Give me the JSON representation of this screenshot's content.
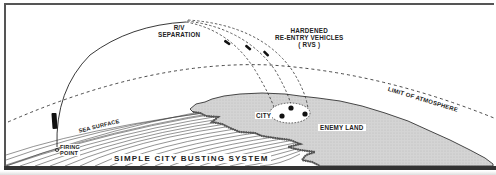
{
  "diagram": {
    "title": "SIMPLE CITY BUSTING SYSTEM",
    "labels": {
      "rv_separation": [
        "R/V",
        "SEPARATION"
      ],
      "hardened_rvs": [
        "HARDENED",
        "RE-ENTRY VEHICLES",
        "( RVS )"
      ],
      "limit_of_atmosphere": "LIMIT OF ATMOSPHERE",
      "sea_surface": "SEA SURFACE",
      "firing_point": [
        "FIRING",
        "POINT"
      ],
      "city": "CITY",
      "enemy_land": "ENEMY LAND"
    },
    "elements": {
      "trajectory": "ballistic-arc",
      "reentry_vehicle_count": 3,
      "city_target_markers": 3
    },
    "colors": {
      "ink": "#222222",
      "land_fill": "#d6d6d6",
      "sea_hatch": "#444444",
      "background": "#ffffff"
    }
  }
}
